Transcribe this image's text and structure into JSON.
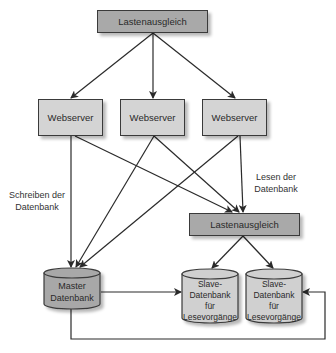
{
  "diagram": {
    "load_balancer_top": {
      "label": "Lastenausgleich"
    },
    "webservers": [
      {
        "label": "Webserver"
      },
      {
        "label": "Webserver"
      },
      {
        "label": "Webserver"
      }
    ],
    "load_balancer_read": {
      "label": "Lastenausgleich"
    },
    "master_db": {
      "line1": "Master",
      "line2": "Datenbank"
    },
    "slave_dbs": [
      {
        "line1": "Slave-",
        "line2": "Datenbank",
        "line3": "für",
        "line4": "Lesevorgänge"
      },
      {
        "line1": "Slave-",
        "line2": "Datenbank",
        "line3": "für",
        "line4": "Lesevorgänge"
      }
    ],
    "annotations": {
      "write": {
        "line1": "Schreiben der",
        "line2": "Datenbank"
      },
      "read": {
        "line1": "Lesen der",
        "line2": "Datenbank"
      }
    },
    "colors": {
      "load_balancer": "#a9a9a9",
      "webserver": "#d4d4d4",
      "master_db": "#a8a8a8",
      "slave_db": "#d0d0d0",
      "line": "#2a2a2a"
    }
  }
}
